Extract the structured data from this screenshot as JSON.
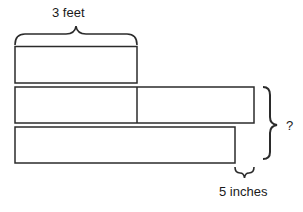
{
  "diagram": {
    "top_label": "3 feet",
    "right_label": "?",
    "bottom_label": "5 inches",
    "bars": [
      {
        "name": "bar-1",
        "segments": 1
      },
      {
        "name": "bar-2",
        "segments": 2
      },
      {
        "name": "bar-3",
        "segments": 1
      }
    ],
    "stroke_color": "#2b2b2b"
  }
}
